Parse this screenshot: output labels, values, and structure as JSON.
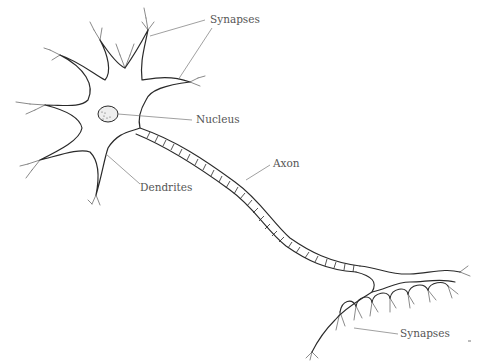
{
  "diagram": {
    "labels": {
      "synapses_top": "Synapses",
      "nucleus": "Nucleus",
      "dendrites": "Dendrites",
      "axon": "Axon",
      "synapses_bottom": "Synapses"
    },
    "colors": {
      "background": "#ffffff",
      "outline": "#2a2a2a",
      "label_text": "#555555",
      "leader_line": "#777777"
    }
  }
}
